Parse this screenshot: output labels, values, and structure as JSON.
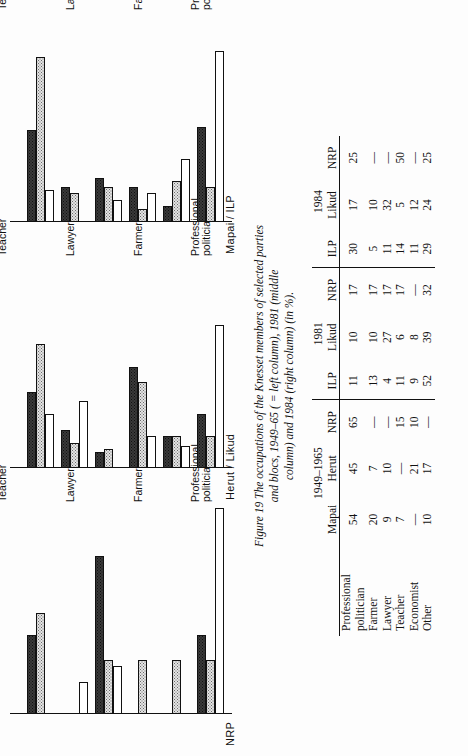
{
  "figure": {
    "number": "Figure 19",
    "caption_line1": "The occupations of the Knesset members of selected parties",
    "caption_line2": "and blocs, 1949–65 ( = left column), 1981 (middle",
    "caption_line3": "column) and 1984 (right column) (in %)."
  },
  "panels": [
    {
      "name": "NRP",
      "title": "NRP"
    },
    {
      "name": "Herut / Likud",
      "title": "Herut / Likud"
    },
    {
      "name": "Mapai / ILP",
      "title": "Mapai / ILP"
    }
  ],
  "categories": [
    {
      "line1": "Professional",
      "line2": "politician"
    },
    {
      "line1": "Farmer",
      "line2": ""
    },
    {
      "line1": "Lawyer",
      "line2": ""
    },
    {
      "line1": "Teacher",
      "line2": ""
    },
    {
      "line1": "Economist",
      "line2": ""
    },
    {
      "line1": "Other",
      "line2": ""
    }
  ],
  "series_labels": {
    "s1965": "1949–65",
    "s1981": "1981",
    "s1984": "1984"
  },
  "chart_data": {
    "type": "bar",
    "orientation": "horizontal",
    "title": "The occupations of the Knesset members of selected parties and blocs, 1949–65 ( = left column), 1981 (middle column) and 1984 (right column) (in %).",
    "xlabel": "",
    "ylabel": "",
    "xlim": [
      0,
      65
    ],
    "grid": false,
    "legend": "none",
    "categories": [
      "Professional politician",
      "Farmer",
      "Lawyer",
      "Teacher",
      "Economist",
      "Other"
    ],
    "panels": [
      {
        "name": "Mapai / ILP",
        "series": [
          {
            "name": "1949–65",
            "values": [
              54,
              20,
              9,
              7,
              null,
              10
            ]
          },
          {
            "name": "1981",
            "values": [
              11,
              13,
              4,
              11,
              9,
              52
            ]
          },
          {
            "name": "1984",
            "values": [
              30,
              5,
              11,
              14,
              11,
              29
            ]
          }
        ]
      },
      {
        "name": "Herut / Likud",
        "series": [
          {
            "name": "1949–65",
            "values": [
              45,
              7,
              10,
              null,
              21,
              17
            ]
          },
          {
            "name": "1981",
            "values": [
              10,
              10,
              27,
              6,
              8,
              39
            ]
          },
          {
            "name": "1984",
            "values": [
              17,
              10,
              32,
              5,
              12,
              24
            ]
          }
        ]
      },
      {
        "name": "NRP",
        "series": [
          {
            "name": "1949–65",
            "values": [
              65,
              null,
              null,
              15,
              10,
              null
            ]
          },
          {
            "name": "1981",
            "values": [
              17,
              17,
              17,
              17,
              null,
              32
            ]
          },
          {
            "name": "1984",
            "values": [
              25,
              null,
              null,
              50,
              null,
              25
            ]
          }
        ]
      }
    ]
  },
  "table": {
    "group_headers": [
      {
        "label": "1949–1965",
        "span": 3
      },
      {
        "label": "1981",
        "span": 3
      },
      {
        "label": "1984",
        "span": 3
      }
    ],
    "column_headers": [
      "Mapai",
      "Herut",
      "NRP",
      "ILP",
      "Likud",
      "NRP",
      "ILP",
      "Likud",
      "NRP"
    ],
    "rows": [
      {
        "label_line1": "Professional",
        "label_line2": "politician",
        "values": [
          "54",
          "45",
          "65",
          "11",
          "10",
          "17",
          "30",
          "17",
          "25"
        ]
      },
      {
        "label_line1": "Farmer",
        "label_line2": "",
        "values": [
          "20",
          "7",
          "—",
          "13",
          "10",
          "17",
          "5",
          "10",
          "—"
        ]
      },
      {
        "label_line1": "Lawyer",
        "label_line2": "",
        "values": [
          "9",
          "10",
          "—",
          "4",
          "27",
          "17",
          "11",
          "32",
          "—"
        ]
      },
      {
        "label_line1": "Teacher",
        "label_line2": "",
        "values": [
          "7",
          "—",
          "15",
          "11",
          "6",
          "17",
          "14",
          "5",
          "50"
        ]
      },
      {
        "label_line1": "Economist",
        "label_line2": "",
        "values": [
          "—",
          "21",
          "10",
          "9",
          "8",
          "—",
          "11",
          "12",
          "—"
        ]
      },
      {
        "label_line1": "Other",
        "label_line2": "",
        "values": [
          "10",
          "17",
          "—",
          "52",
          "39",
          "32",
          "29",
          "24",
          "25"
        ]
      }
    ]
  },
  "colors": {
    "ink": "#111111",
    "paper": "#fdfdfd",
    "bar_1965": "#ffffff",
    "bar_1981": "#e3e3e3",
    "bar_1984": "#3a3a3a"
  }
}
